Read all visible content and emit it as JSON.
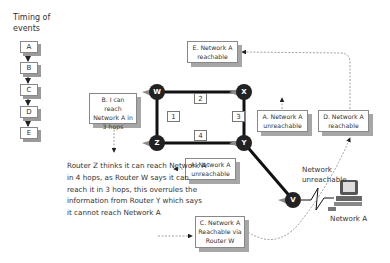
{
  "timeline": {
    "title": "Timing of events",
    "events": [
      "A",
      "B",
      "C",
      "D",
      "E"
    ]
  },
  "routers": {
    "w": "W",
    "x": "X",
    "y": "Y",
    "z": "Z",
    "v": "V"
  },
  "link_labels": {
    "wz": "1",
    "wx": "2",
    "xy": "3",
    "zy": "4"
  },
  "notes": {
    "a_top": "A. Network A unreachable",
    "a_bottom": "A. Network A unreachable",
    "b": "B. I can reach Network A in 3 hops",
    "c": "C. Network A Reachable via Router W",
    "d": "D. Network A reachable",
    "e": "E. Network A reachable"
  },
  "explanation": "Router Z thinks it can reach Network A in 4 hops, as Router W says it can reach it in 3 hops, this overrules the information from Router Y which says it cannot reach Network A",
  "network_unreachable": "Network unreachable",
  "network_label": "Network A",
  "colors": {
    "link": "#111111",
    "router": "#222222",
    "shadow": "#a6a6a6",
    "dashed": "#888888"
  }
}
